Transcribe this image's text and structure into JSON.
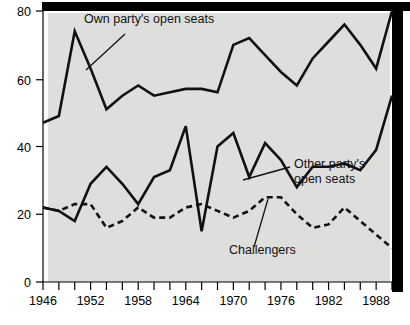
{
  "chart_data": {
    "type": "line",
    "title": "",
    "subtitle": "",
    "xlabel": "",
    "ylabel": "",
    "xlim": [
      1946,
      1990
    ],
    "ylim": [
      0,
      80
    ],
    "grid": false,
    "legend_position": "inline-annotations",
    "x": [
      1946,
      1948,
      1950,
      1952,
      1954,
      1956,
      1958,
      1960,
      1962,
      1964,
      1966,
      1968,
      1970,
      1972,
      1974,
      1976,
      1978,
      1980,
      1982,
      1984,
      1986,
      1988,
      1990
    ],
    "y_ticks": [
      0,
      20,
      40,
      60,
      80
    ],
    "x_ticks": [
      1946,
      1948,
      1950,
      1952,
      1954,
      1956,
      1958,
      1960,
      1962,
      1964,
      1966,
      1968,
      1970,
      1972,
      1974,
      1976,
      1978,
      1980,
      1982,
      1984,
      1986,
      1988,
      1990
    ],
    "x_tick_labels": [
      "1946",
      "",
      "",
      "1952",
      "",
      "",
      "1958",
      "",
      "",
      "1964",
      "",
      "",
      "1970",
      "",
      "",
      "1976",
      "",
      "",
      "1982",
      "",
      "",
      "1988",
      ""
    ],
    "series": [
      {
        "name": "Own party's open seats",
        "style": "solid",
        "values": [
          47,
          49,
          74,
          63,
          51,
          55,
          58,
          55,
          56,
          57,
          57,
          56,
          70,
          72,
          67,
          62,
          58,
          66,
          71,
          76,
          70,
          63,
          80
        ]
      },
      {
        "name": "Other party's open seats",
        "style": "solid",
        "values": [
          22,
          21,
          18,
          29,
          34,
          29,
          23,
          31,
          33,
          46,
          15,
          40,
          44,
          31,
          41,
          36,
          28,
          34,
          34,
          35,
          33,
          39,
          55
        ]
      },
      {
        "name": "Challengers",
        "style": "dashed",
        "values": [
          22,
          21,
          23,
          23,
          16,
          18,
          22,
          19,
          19,
          22,
          23,
          21,
          19,
          21,
          25,
          25,
          20,
          16,
          17,
          22,
          18,
          14,
          10
        ]
      }
    ],
    "annotations": [
      {
        "text": "Own party's open seats",
        "series": "Own party's open seats"
      },
      {
        "text": "Other party's",
        "series": "Other party's open seats"
      },
      {
        "text": "open seats",
        "series": "Other party's open seats"
      },
      {
        "text": "Challengers",
        "series": "Challengers"
      }
    ],
    "y_tick_labels": [
      "0",
      "20",
      "40",
      "60",
      "80"
    ],
    "colors": {
      "line": "#111111",
      "plot_background": "#dededc",
      "page_background": "#ffffff",
      "axis": "#000000"
    }
  },
  "axis": {
    "y": {
      "t0": "0",
      "t20": "20",
      "t40": "40",
      "t60": "60",
      "t80": "80"
    },
    "x": {
      "t1946": "1946",
      "t1952": "1952",
      "t1958": "1958",
      "t1964": "1964",
      "t1970": "1970",
      "t1976": "1976",
      "t1982": "1982",
      "t1988": "1988"
    }
  },
  "labels": {
    "own_party": "Own party's open seats",
    "other_party_line1": "Other party's",
    "other_party_line2": "open seats",
    "challengers": "Challengers"
  }
}
